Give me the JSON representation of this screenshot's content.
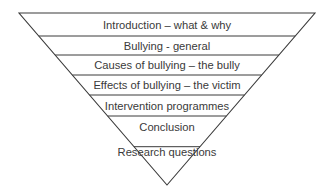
{
  "diagram": {
    "type": "inverted-pyramid",
    "line_color": "#3a3a3a",
    "text_color": "#3a3a3a",
    "levels": [
      {
        "label": "Introduction – what & why"
      },
      {
        "label": "Bullying - general"
      },
      {
        "label": "Causes of bullying – the bully"
      },
      {
        "label": "Effects of bullying – the victim"
      },
      {
        "label": "Intervention programmes"
      },
      {
        "label": "Conclusion"
      },
      {
        "label": "Research questions"
      }
    ]
  }
}
